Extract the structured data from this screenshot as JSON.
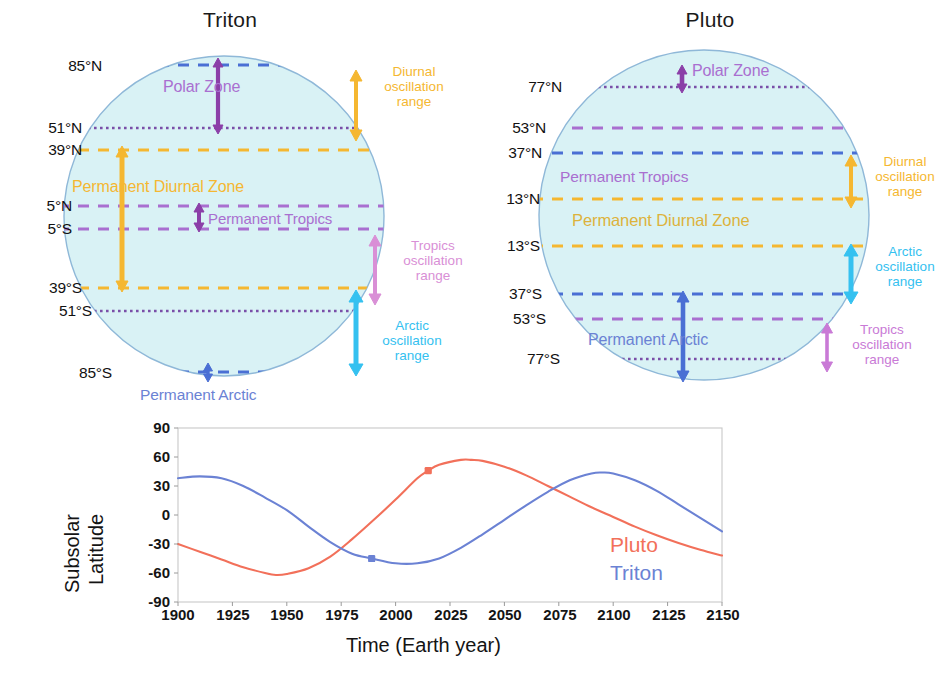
{
  "figure": {
    "background": "#ffffff",
    "body_fill": "#d9f2f5",
    "body_stroke": "#8fb8d8"
  },
  "colors": {
    "polar_purple": "#8b3fa8",
    "tropics_purple": "#a96fd0",
    "tropics_pink": "#d98fd6",
    "diurnal_orange": "#f5b731",
    "arctic_cyan": "#35c1f0",
    "arctic_blue": "#4a6fd4",
    "pluto_red": "#f2705a",
    "triton_blue": "#6b82d4",
    "label_black": "#111111"
  },
  "panels": [
    {
      "id": "triton",
      "title": "Triton",
      "latitudes": [
        {
          "label": "85°N",
          "value": 85,
          "style": "dashed",
          "color": "#4a6fd4"
        },
        {
          "label": "51°N",
          "value": 51,
          "style": "dotted",
          "color": "#7a4fa8"
        },
        {
          "label": "39°N",
          "value": 39,
          "style": "dashed",
          "color": "#f5b731"
        },
        {
          "label": "5°N",
          "value": 5,
          "style": "dashed",
          "color": "#a96fd0"
        },
        {
          "label": "5°S",
          "value": -5,
          "style": "dashed",
          "color": "#a96fd0"
        },
        {
          "label": "39°S",
          "value": -39,
          "style": "dashed",
          "color": "#f5b731"
        },
        {
          "label": "51°S",
          "value": -51,
          "style": "dotted",
          "color": "#7a4fa8"
        },
        {
          "label": "85°S",
          "value": -85,
          "style": "dashed",
          "color": "#4a6fd4"
        }
      ],
      "zones": [
        {
          "name": "Polar Zone",
          "label": "Polar Zone",
          "color": "#a96fd0"
        },
        {
          "name": "Permanent Diurnal Zone",
          "label": "Permanent Diurnal Zone",
          "color": "#f5b731"
        },
        {
          "name": "Permanent Tropics",
          "label": "Permanent Tropics",
          "color": "#a96fd0"
        },
        {
          "name": "Permanent Arctic",
          "label": "Permanent Arctic",
          "color": "#6b82d4"
        }
      ],
      "ranges": [
        {
          "name": "diurnal",
          "label": "Diurnal\noscillation\nrange",
          "color": "#f5b731"
        },
        {
          "name": "tropics",
          "label": "Tropics\noscillation\nrange",
          "color": "#d98fd6"
        },
        {
          "name": "arctic",
          "label": "Arctic\noscillation\nrange",
          "color": "#35c1f0"
        }
      ]
    },
    {
      "id": "pluto",
      "title": "Pluto",
      "latitudes": [
        {
          "label": "77°N",
          "value": 77,
          "style": "dotted",
          "color": "#7a4fa8"
        },
        {
          "label": "53°N",
          "value": 53,
          "style": "dashed",
          "color": "#a96fd0"
        },
        {
          "label": "37°N",
          "value": 37,
          "style": "dashed",
          "color": "#4a6fd4"
        },
        {
          "label": "13°N",
          "value": 13,
          "style": "dashed",
          "color": "#f5b731"
        },
        {
          "label": "13°S",
          "value": -13,
          "style": "dashed",
          "color": "#f5b731"
        },
        {
          "label": "37°S",
          "value": -37,
          "style": "dashed",
          "color": "#4a6fd4"
        },
        {
          "label": "53°S",
          "value": -53,
          "style": "dashed",
          "color": "#a96fd0"
        },
        {
          "label": "77°S",
          "value": -77,
          "style": "dotted",
          "color": "#7a4fa8"
        }
      ],
      "zones": [
        {
          "name": "Polar Zone",
          "label": "Polar Zone",
          "color": "#a96fd0"
        },
        {
          "name": "Permanent Tropics",
          "label": "Permanent Tropics",
          "color": "#a96fd0"
        },
        {
          "name": "Permanent Diurnal Zone",
          "label": "Permanent Diurnal Zone",
          "color": "#ddb23c"
        },
        {
          "name": "Permanent Arctic",
          "label": "Permanent Arctic",
          "color": "#6b82d4"
        }
      ],
      "ranges": [
        {
          "name": "diurnal",
          "label": "Diurnal\noscillation\nrange",
          "color": "#f5b731"
        },
        {
          "name": "arctic",
          "label": "Arctic\noscillation\nrange",
          "color": "#35c1f0"
        },
        {
          "name": "tropics",
          "label": "Tropics\noscillation\nrange",
          "color": "#c97ad6"
        }
      ]
    }
  ],
  "chart_data": {
    "type": "line",
    "title": "",
    "xlabel": "Time (Earth year)",
    "ylabel": "Subsolar Latitude",
    "xlim": [
      1900,
      2150
    ],
    "ylim": [
      -90,
      90
    ],
    "xticks": [
      1900,
      1925,
      1950,
      1975,
      2000,
      2025,
      2050,
      2075,
      2100,
      2125,
      2150
    ],
    "yticks": [
      -90,
      -60,
      -30,
      0,
      30,
      60,
      90
    ],
    "grid": false,
    "legend_position": "inside-lower-right",
    "series": [
      {
        "name": "Pluto",
        "color": "#f2705a",
        "marker": {
          "x": 2015,
          "y": 46
        },
        "x": [
          1900,
          1910,
          1920,
          1930,
          1940,
          1945,
          1950,
          1960,
          1970,
          1980,
          1990,
          2000,
          2010,
          2015,
          2020,
          2030,
          2035,
          2040,
          2050,
          2060,
          2070,
          2080,
          2090,
          2100,
          2110,
          2120,
          2130,
          2140,
          2150
        ],
        "y": [
          -30,
          -38,
          -46,
          -54,
          -60,
          -62,
          -61,
          -55,
          -43,
          -25,
          -5,
          16,
          38,
          46,
          52,
          57,
          57,
          56,
          50,
          41,
          30,
          19,
          8,
          -2,
          -12,
          -21,
          -29,
          -36,
          -42
        ]
      },
      {
        "name": "Triton",
        "color": "#6b82d4",
        "marker": {
          "x": 1989,
          "y": -45
        },
        "x": [
          1900,
          1910,
          1920,
          1930,
          1940,
          1950,
          1960,
          1970,
          1980,
          1989,
          2000,
          2010,
          2020,
          2030,
          2040,
          2050,
          2060,
          2070,
          2080,
          2090,
          2095,
          2100,
          2110,
          2120,
          2130,
          2140,
          2150
        ],
        "y": [
          38,
          40,
          38,
          30,
          18,
          5,
          -12,
          -28,
          -40,
          -45,
          -50,
          -50,
          -45,
          -34,
          -20,
          -5,
          10,
          24,
          36,
          43,
          44,
          43,
          36,
          25,
          11,
          -3,
          -17
        ]
      }
    ]
  }
}
